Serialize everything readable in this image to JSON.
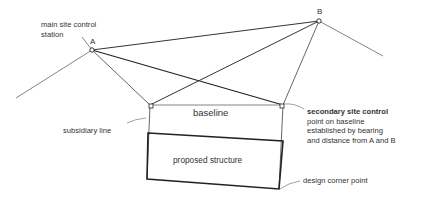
{
  "diagram": {
    "points": {
      "a": {
        "label": "A",
        "x": 92,
        "y": 50
      },
      "b": {
        "label": "B",
        "x": 319,
        "y": 21
      }
    },
    "labels": {
      "main_station_line1": "main site control",
      "main_station_line2": "station",
      "baseline": "baseline",
      "subsidiary_line": "subsidiary line",
      "proposed_structure": "proposed structure",
      "secondary_line1": "secondary site control",
      "secondary_line2": "point on baseline",
      "secondary_line3": "established by bearing",
      "secondary_line4": "and distance from A and B",
      "design_corner": "design corner point"
    },
    "colors": {
      "line": "#555555",
      "heavy_line": "#222222",
      "text": "#333333"
    }
  }
}
